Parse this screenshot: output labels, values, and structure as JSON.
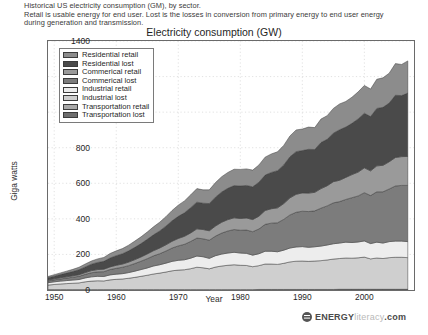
{
  "caption": {
    "line1": "Historical US electricity consumption (GM), by sector.",
    "line2": "Retail is usable energy for end user. Lost is the losses in conversion from primary energy to end user energy",
    "line3": "during generation and transmission."
  },
  "brand": {
    "mark": "energy-literacy-logo",
    "part1": "ENERGY",
    "part2": "literacy",
    "part3": ".com"
  },
  "colors": {
    "residential_retail": "#8c8c8c",
    "residential_lost": "#4a4a4a",
    "commerical_retail": "#9a9a9a",
    "commerical_lost": "#7c7c7c",
    "industrial_retail": "#ededed",
    "industrial_lost": "#cfcfcf",
    "transportation_retail": "#a8a8a8",
    "transportation_lost": "#6e6e6e",
    "axis": "#6a6a6a",
    "grid": "#cccccc",
    "line": "#3c3c3c"
  },
  "chart_data": {
    "type": "area",
    "stacked": true,
    "title": "Electricity consumption (GW)",
    "xlabel": "Year",
    "ylabel": "Giga watts",
    "xlim": [
      1949,
      2008
    ],
    "ylim": [
      0,
      1400
    ],
    "yticks": [
      0,
      200,
      400,
      600,
      800,
      1000,
      1200,
      1400
    ],
    "xticks": [
      1950,
      1960,
      1970,
      1980,
      1990,
      2000
    ],
    "grid": true,
    "legend_position": "upper-left",
    "x": [
      1949,
      1950,
      1951,
      1952,
      1953,
      1954,
      1955,
      1956,
      1957,
      1958,
      1959,
      1960,
      1961,
      1962,
      1963,
      1964,
      1965,
      1966,
      1967,
      1968,
      1969,
      1970,
      1971,
      1972,
      1973,
      1974,
      1975,
      1976,
      1977,
      1978,
      1979,
      1980,
      1981,
      1982,
      1983,
      1984,
      1985,
      1986,
      1987,
      1988,
      1989,
      1990,
      1991,
      1992,
      1993,
      1994,
      1995,
      1996,
      1997,
      1998,
      1999,
      2000,
      2001,
      2002,
      2003,
      2004,
      2005,
      2006,
      2007
    ],
    "series": [
      {
        "name": "Transportation lost",
        "values": [
          1,
          1,
          1,
          1,
          1,
          1,
          1,
          1,
          1,
          1,
          1,
          1,
          1,
          1,
          1,
          1,
          1,
          1,
          1,
          1,
          1,
          1,
          1,
          1,
          1,
          1,
          1,
          1,
          1,
          1,
          1,
          1,
          1,
          1,
          2,
          2,
          2,
          2,
          2,
          2,
          2,
          2,
          2,
          2,
          2,
          2,
          2,
          3,
          3,
          3,
          3,
          3,
          3,
          3,
          3,
          3,
          3,
          3,
          3
        ]
      },
      {
        "name": "Transportation retail",
        "values": [
          1,
          1,
          1,
          1,
          1,
          1,
          1,
          1,
          1,
          1,
          1,
          1,
          1,
          1,
          1,
          1,
          1,
          1,
          1,
          1,
          1,
          1,
          1,
          1,
          1,
          1,
          1,
          1,
          1,
          1,
          1,
          1,
          1,
          1,
          1,
          1,
          1,
          1,
          1,
          1,
          1,
          1,
          1,
          1,
          1,
          1,
          1,
          1,
          1,
          1,
          1,
          1,
          1,
          1,
          1,
          1,
          1,
          1,
          1
        ]
      },
      {
        "name": "Industrial lost",
        "values": [
          26,
          29,
          32,
          34,
          36,
          38,
          44,
          48,
          50,
          49,
          55,
          58,
          60,
          64,
          69,
          75,
          81,
          88,
          93,
          99,
          106,
          110,
          112,
          118,
          126,
          123,
          117,
          127,
          133,
          137,
          140,
          137,
          136,
          129,
          134,
          143,
          143,
          141,
          147,
          155,
          159,
          160,
          158,
          160,
          162,
          166,
          171,
          173,
          176,
          175,
          177,
          181,
          171,
          176,
          173,
          178,
          180,
          180,
          178
        ]
      },
      {
        "name": "Industrial retail",
        "values": [
          13,
          15,
          16,
          17,
          18,
          19,
          22,
          24,
          25,
          25,
          28,
          29,
          30,
          32,
          35,
          38,
          41,
          45,
          47,
          50,
          53,
          55,
          56,
          59,
          63,
          62,
          59,
          64,
          67,
          69,
          70,
          69,
          68,
          65,
          67,
          72,
          72,
          71,
          74,
          78,
          80,
          81,
          79,
          80,
          82,
          84,
          86,
          87,
          89,
          88,
          89,
          91,
          86,
          89,
          87,
          90,
          91,
          91,
          90
        ]
      },
      {
        "name": "Commerical lost",
        "values": [
          10,
          11,
          12,
          14,
          16,
          18,
          20,
          23,
          25,
          27,
          30,
          33,
          36,
          39,
          43,
          47,
          52,
          57,
          62,
          68,
          75,
          81,
          87,
          94,
          101,
          101,
          102,
          110,
          118,
          124,
          128,
          128,
          131,
          132,
          139,
          151,
          158,
          163,
          173,
          186,
          195,
          199,
          201,
          202,
          213,
          220,
          230,
          233,
          240,
          252,
          259,
          271,
          270,
          283,
          288,
          296,
          310,
          313,
          316
        ]
      },
      {
        "name": "Commerical retail",
        "values": [
          5,
          6,
          7,
          7,
          8,
          9,
          10,
          12,
          13,
          14,
          15,
          17,
          18,
          20,
          22,
          24,
          27,
          29,
          32,
          35,
          38,
          42,
          45,
          48,
          52,
          52,
          53,
          57,
          61,
          64,
          66,
          66,
          68,
          68,
          72,
          78,
          81,
          84,
          89,
          96,
          101,
          103,
          104,
          104,
          110,
          113,
          119,
          120,
          124,
          130,
          134,
          140,
          139,
          146,
          149,
          153,
          160,
          162,
          163
        ]
      },
      {
        "name": "Residential lost",
        "values": [
          13,
          15,
          18,
          21,
          24,
          28,
          32,
          36,
          40,
          44,
          50,
          54,
          58,
          63,
          69,
          75,
          82,
          89,
          96,
          105,
          115,
          124,
          132,
          142,
          150,
          148,
          153,
          162,
          170,
          176,
          181,
          183,
          183,
          184,
          191,
          199,
          204,
          209,
          217,
          231,
          240,
          238,
          246,
          241,
          259,
          261,
          273,
          284,
          283,
          288,
          299,
          307,
          305,
          323,
          326,
          330,
          350,
          343,
          356
        ]
      },
      {
        "name": "Residential retail",
        "values": [
          7,
          8,
          9,
          11,
          12,
          14,
          16,
          18,
          20,
          22,
          25,
          27,
          29,
          32,
          35,
          38,
          41,
          45,
          49,
          53,
          58,
          63,
          67,
          72,
          76,
          75,
          77,
          82,
          86,
          89,
          92,
          93,
          93,
          94,
          97,
          101,
          104,
          106,
          110,
          117,
          122,
          121,
          125,
          123,
          132,
          133,
          139,
          145,
          144,
          147,
          152,
          156,
          155,
          164,
          166,
          168,
          178,
          175,
          181
        ]
      }
    ],
    "legend_order": [
      "Residential retail",
      "Residential lost",
      "Commerical retail",
      "Commerical lost",
      "Industrial retail",
      "Industrial lost",
      "Transportation retail",
      "Transportation lost"
    ]
  }
}
